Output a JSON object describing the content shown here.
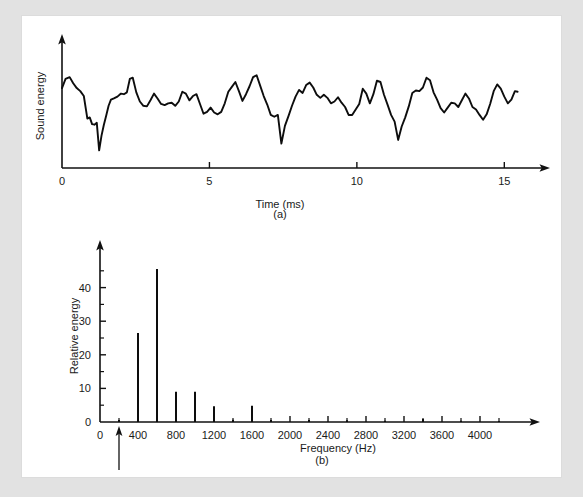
{
  "figure": {
    "panel_a_label": "(a)",
    "panel_b_label": "(b)"
  },
  "chart_data": [
    {
      "type": "line",
      "id": "sound-energy-waveform",
      "title": "",
      "xlabel": "Time (ms)",
      "ylabel": "Sound energy",
      "xlim": [
        0,
        15.6
      ],
      "ylim": [
        0,
        10
      ],
      "xticks": [
        0,
        5,
        10,
        15
      ],
      "xticklabels": [
        "0",
        "5",
        "10",
        "15"
      ],
      "yticks": [],
      "yticklabels": [],
      "grid": false,
      "legend": "none",
      "x": [
        0.0,
        0.12,
        0.26,
        0.38,
        0.5,
        0.62,
        0.74,
        0.86,
        0.94,
        1.02,
        1.1,
        1.18,
        1.26,
        1.34,
        1.42,
        1.5,
        1.58,
        1.66,
        1.76,
        1.88,
        2.0,
        2.1,
        2.2,
        2.3,
        2.4,
        2.52,
        2.64,
        2.76,
        2.88,
        3.0,
        3.12,
        3.24,
        3.36,
        3.48,
        3.6,
        3.72,
        3.84,
        3.96,
        4.08,
        4.2,
        4.32,
        4.44,
        4.56,
        4.68,
        4.8,
        4.92,
        5.04,
        5.16,
        5.28,
        5.4,
        5.52,
        5.64,
        5.76,
        5.88,
        6.0,
        6.12,
        6.24,
        6.36,
        6.48,
        6.6,
        6.72,
        6.84,
        6.96,
        7.08,
        7.2,
        7.32,
        7.44,
        7.56,
        7.68,
        7.8,
        7.92,
        8.04,
        8.16,
        8.28,
        8.4,
        8.52,
        8.64,
        8.76,
        8.88,
        9.0,
        9.12,
        9.24,
        9.36,
        9.48,
        9.6,
        9.72,
        9.84,
        9.96,
        10.08,
        10.2,
        10.32,
        10.44,
        10.56,
        10.68,
        10.8,
        10.92,
        11.04,
        11.16,
        11.28,
        11.4,
        11.52,
        11.64,
        11.76,
        11.88,
        12.0,
        12.12,
        12.24,
        12.36,
        12.48,
        12.6,
        12.72,
        12.84,
        12.96,
        13.08,
        13.2,
        13.32,
        13.44,
        13.56,
        13.68,
        13.8,
        13.92,
        14.04,
        14.16,
        14.28,
        14.4,
        14.52,
        14.64,
        14.76,
        14.88,
        15.0,
        15.12,
        15.24,
        15.36,
        15.45
      ],
      "y": [
        6.55,
        7.3,
        7.45,
        6.95,
        6.55,
        6.3,
        5.9,
        4.05,
        4.15,
        3.6,
        3.55,
        3.7,
        1.45,
        2.65,
        3.55,
        4.3,
        5.1,
        5.6,
        5.7,
        5.85,
        6.1,
        6.05,
        6.2,
        7.3,
        7.4,
        6.2,
        5.45,
        5.1,
        5.05,
        5.55,
        6.1,
        5.7,
        5.25,
        5.15,
        5.3,
        5.35,
        5.1,
        5.45,
        6.25,
        6.1,
        5.55,
        5.9,
        6.05,
        5.25,
        4.45,
        4.6,
        4.95,
        4.55,
        4.4,
        4.6,
        5.3,
        6.25,
        6.65,
        7.05,
        6.3,
        5.5,
        6.05,
        6.7,
        7.45,
        7.6,
        6.75,
        5.9,
        5.2,
        4.35,
        4.2,
        4.35,
        2.0,
        3.45,
        4.25,
        5.1,
        5.85,
        6.4,
        6.15,
        6.8,
        7.0,
        6.6,
        6.0,
        5.75,
        6.0,
        5.75,
        5.3,
        5.45,
        5.8,
        5.35,
        5.0,
        4.35,
        4.35,
        4.8,
        5.25,
        6.5,
        6.1,
        5.3,
        6.05,
        7.15,
        7.05,
        6.0,
        5.2,
        4.35,
        3.8,
        2.3,
        3.4,
        4.15,
        5.05,
        6.15,
        6.35,
        6.3,
        6.6,
        7.4,
        7.2,
        6.2,
        5.6,
        4.9,
        4.55,
        4.95,
        5.35,
        5.3,
        5.0,
        5.55,
        6.1,
        5.7,
        5.0,
        4.8,
        4.35,
        3.95,
        4.4,
        5.25,
        6.3,
        6.85,
        6.5,
        5.85,
        5.3,
        5.6,
        6.3,
        6.25
      ]
    },
    {
      "type": "bar",
      "id": "harmonic-spectrum",
      "title": "",
      "xlabel": "Frequency (Hz)",
      "ylabel": "Relative energy",
      "xlim": [
        0,
        4400
      ],
      "ylim": [
        0,
        50
      ],
      "xticks": [
        0,
        200,
        400,
        600,
        800,
        1000,
        1200,
        1400,
        1600,
        1800,
        2000,
        2200,
        2400,
        2600,
        2800,
        3000,
        3200,
        3400,
        3600,
        3800,
        4000,
        4200
      ],
      "xticklabels_major": {
        "0": "0",
        "400": "400",
        "800": "800",
        "1200": "1200",
        "1600": "1600",
        "2000": "2000",
        "2400": "2400",
        "2800": "2800",
        "3200": "3200",
        "3600": "3600",
        "4000": "4000"
      },
      "yticks": [
        0,
        10,
        20,
        30,
        40
      ],
      "yticklabels": [
        "0",
        "10",
        "20",
        "30",
        "40"
      ],
      "y_minor_ticks": [
        5,
        15,
        25,
        35,
        45
      ],
      "grid": false,
      "legend": "none",
      "categories": [
        200,
        400,
        600,
        800,
        1000,
        1200,
        1400,
        1600,
        1800,
        2200,
        2600,
        3000,
        3400,
        3800,
        4200
      ],
      "values": [
        0.6,
        26.5,
        45.5,
        9.0,
        9.0,
        4.7,
        0.7,
        4.8,
        0.6,
        0.6,
        0.5,
        0.4,
        0.9,
        0.4,
        0.3
      ],
      "annotations": [
        {
          "text": "Fundamental",
          "points_to_x": 200,
          "points_to_y": 0
        }
      ]
    }
  ]
}
